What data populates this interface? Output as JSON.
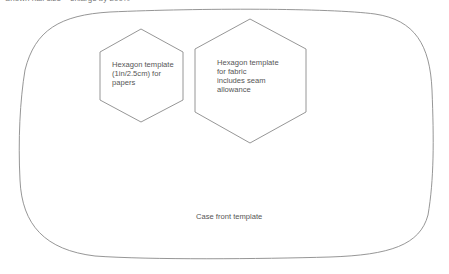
{
  "header": {
    "note": "Shown half size – enlarge by 200%"
  },
  "templates": {
    "small_hexagon": {
      "lines": [
        "Hexagon template",
        "(1in/2.5cm) for",
        "papers"
      ]
    },
    "large_hexagon": {
      "lines": [
        "Hexagon template",
        "for fabric",
        "includes seam",
        "allowance"
      ]
    },
    "case_front": {
      "label": "Case front template"
    }
  },
  "colors": {
    "outline": "#8a8a8a",
    "text": "#555555",
    "background": "#ffffff"
  }
}
